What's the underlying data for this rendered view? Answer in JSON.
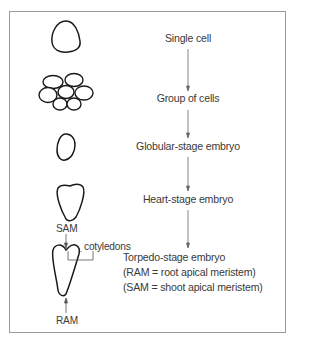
{
  "diagram": {
    "title": "",
    "stages": [
      {
        "label": "Single cell",
        "shape": "single-cell"
      },
      {
        "label": "Group of cells",
        "shape": "cell-cluster"
      },
      {
        "label": "Globular-stage embryo",
        "shape": "globular-embryo"
      },
      {
        "label": "Heart-stage embryo",
        "shape": "heart-embryo"
      },
      {
        "label": "Torpedo-stage embryo",
        "shape": "torpedo-embryo"
      }
    ],
    "torpedo_notes": [
      "(RAM = root apical meristem)",
      "(SAM = shoot apical meristem)"
    ],
    "annotations": {
      "sam": "SAM",
      "ram": "RAM",
      "cotyledons": "cotyledons"
    },
    "colors": {
      "stroke": "#1a1a1a",
      "text": "#3a3a3a",
      "arrow": "#555555",
      "frame": "#9a9a9a"
    }
  }
}
